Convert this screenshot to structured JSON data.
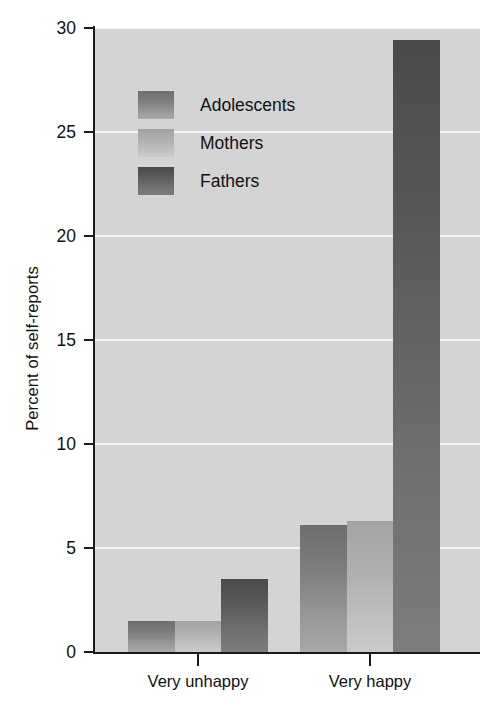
{
  "chart_data": {
    "type": "bar",
    "title": "",
    "xlabel": "",
    "ylabel": "Percent of self-reports",
    "categories": [
      "Very unhappy",
      "Very happy"
    ],
    "series": [
      {
        "name": "Adolescents",
        "values": [
          1.5,
          6.1
        ],
        "color": "#7d7d7d"
      },
      {
        "name": "Mothers",
        "values": [
          1.5,
          6.3
        ],
        "color": "#b5b5b5"
      },
      {
        "name": "Fathers",
        "values": [
          3.5,
          29.4
        ],
        "color": "#585858"
      }
    ],
    "ylim": [
      0,
      30
    ],
    "yticks": [
      0,
      5,
      10,
      15,
      20,
      25,
      30
    ],
    "ytick_labels": [
      "0",
      "5",
      "10",
      "15",
      "20",
      "25",
      "30"
    ],
    "grid": true,
    "grid_color": "#f2f2f2",
    "grid_axis": "y",
    "legend_position": "upper left inside",
    "plot_background": "#d4d4d4",
    "figure_background": "#ffffff"
  },
  "axis": {
    "y_title": "Percent of self-reports",
    "tick_labels": [
      "30",
      "25",
      "20",
      "15",
      "10",
      "5",
      "0"
    ],
    "x_labels": [
      "Very unhappy",
      "Very happy"
    ]
  },
  "legend": {
    "items": [
      {
        "label": "Adolescents"
      },
      {
        "label": "Mothers"
      },
      {
        "label": "Fathers"
      }
    ]
  }
}
